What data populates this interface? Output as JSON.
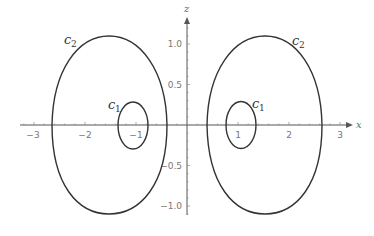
{
  "chart_data": {
    "type": "line",
    "title": "",
    "xlabel": "x",
    "ylabel": "z",
    "xlim": [
      -3.3,
      3.3
    ],
    "ylim": [
      -1.3,
      1.3
    ],
    "x_ticks": [
      "-3",
      "-2",
      "-1",
      "1",
      "2",
      "3"
    ],
    "z_ticks": [
      "1.0",
      "0.5",
      "-0.5",
      "-1.0"
    ],
    "grid": false,
    "series": [
      {
        "name": "c2 (left)",
        "shape": "closed-curve",
        "x_range": [
          -2.64,
          -0.39
        ],
        "z_range": [
          -1.1,
          1.1
        ],
        "label": "c2"
      },
      {
        "name": "c1 (left)",
        "shape": "closed-curve",
        "x_range": [
          -1.35,
          -0.76
        ],
        "z_range": [
          -0.29,
          0.29
        ],
        "label": "c1"
      },
      {
        "name": "c2 (right)",
        "shape": "closed-curve",
        "x_range": [
          0.39,
          2.64
        ],
        "z_range": [
          -1.1,
          1.1
        ],
        "label": "c2"
      },
      {
        "name": "c1 (right)",
        "shape": "closed-curve",
        "x_range": [
          0.76,
          1.35
        ],
        "z_range": [
          -0.29,
          0.29
        ],
        "label": "c1"
      }
    ]
  },
  "axes": {
    "x_name": "x",
    "z_name": "z",
    "x_tick_labels": [
      {
        "v": -3,
        "text": "−3"
      },
      {
        "v": -2,
        "text": "−2"
      },
      {
        "v": -1,
        "text": "−1"
      },
      {
        "v": 1,
        "text": "1"
      },
      {
        "v": 2,
        "text": "2"
      },
      {
        "v": 3,
        "text": "3"
      }
    ],
    "z_tick_labels": [
      {
        "v": 1.0,
        "text": "1.0"
      },
      {
        "v": 0.5,
        "text": "0.5"
      },
      {
        "v": -0.5,
        "text": "−0.5"
      },
      {
        "v": -1.0,
        "text": "−1.0"
      }
    ]
  },
  "labels": {
    "c2_left": {
      "main": "c",
      "sub": "2"
    },
    "c1_left": {
      "main": "c",
      "sub": "1"
    },
    "c2_right": {
      "main": "c",
      "sub": "2"
    },
    "c1_right": {
      "main": "c",
      "sub": "1"
    }
  },
  "colors": {
    "curve": "#333333",
    "axis": "#555555",
    "tick_text": "#777777"
  }
}
